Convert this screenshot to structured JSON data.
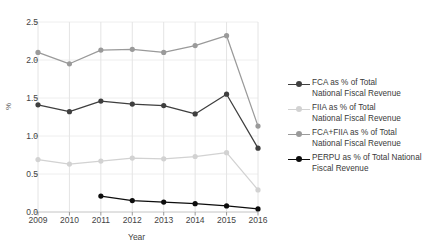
{
  "chart_data": {
    "type": "line",
    "title": "",
    "xlabel": "Year",
    "ylabel": "%",
    "x": [
      2009,
      2010,
      2011,
      2012,
      2013,
      2014,
      2015,
      2016
    ],
    "xticklabels": [
      "2009",
      "2010",
      "2011",
      "2012",
      "2013",
      "2014",
      "2015",
      "2016"
    ],
    "yticklabels": [
      "0.0",
      "0.5",
      "1.0",
      "1.5",
      "2.0",
      "2.5"
    ],
    "yticks": [
      0.0,
      0.5,
      1.0,
      1.5,
      2.0,
      2.5
    ],
    "ylim": [
      0.0,
      2.5
    ],
    "xlim": [
      2009,
      2016
    ],
    "grid": true,
    "legend_position": "right",
    "series": [
      {
        "name": "FCA as % of Total National Fiscal Revenue",
        "color": "#3f3f3f",
        "marker": "circle",
        "values": [
          1.41,
          1.32,
          1.46,
          1.42,
          1.4,
          1.29,
          1.55,
          0.84
        ]
      },
      {
        "name": "FIIA as % of Total National Fiscal Revenue",
        "color": "#d2d2d2",
        "marker": "circle",
        "values": [
          0.69,
          0.63,
          0.67,
          0.71,
          0.7,
          0.73,
          0.78,
          0.29
        ]
      },
      {
        "name": "FCA+FIIA as % of Total National Fiscal Revenue",
        "color": "#9a9a9a",
        "marker": "circle",
        "values": [
          2.1,
          1.95,
          2.13,
          2.14,
          2.1,
          2.19,
          2.32,
          1.13
        ]
      },
      {
        "name": "PERPU as % of Total National Fiscal Revenue",
        "color": "#0d0d0d",
        "marker": "circle",
        "values": [
          null,
          null,
          0.21,
          0.15,
          0.13,
          0.11,
          0.08,
          0.04
        ]
      }
    ]
  },
  "legend": {
    "items": [
      {
        "label": "FCA as % of Total\nNational Fiscal Revenue",
        "color": "#3f3f3f"
      },
      {
        "label": "FIIA as % of Total\nNational Fiscal Revenue",
        "color": "#d2d2d2"
      },
      {
        "label": "FCA+FIIA as % of Total\nNational Fiscal Revenue",
        "color": "#9a9a9a"
      },
      {
        "label": "PERPU as % of Total National\nFiscal Revenue",
        "color": "#0d0d0d"
      }
    ]
  },
  "axes": {
    "xlabel": "Year",
    "ylabel": "%"
  }
}
